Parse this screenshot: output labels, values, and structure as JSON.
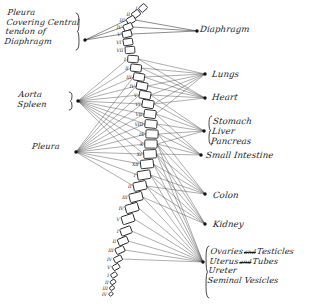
{
  "figure": {
    "background_color": "#ffffff",
    "ink_color": "#1a1a1a",
    "line_color": "#4a4a4a"
  },
  "left_labels": [
    {
      "id": "pleura-central-tendon",
      "lines": [
        "Pleura",
        "Covering Central",
        "tendon of",
        "Diaphragm"
      ],
      "x": 6,
      "y": 8,
      "brace": true
    },
    {
      "id": "aorta-spleen",
      "lines": [
        "Aorta",
        "Spleen"
      ],
      "x": 18,
      "y": 90,
      "brace": true
    },
    {
      "id": "pleura-lower",
      "lines": [
        "Pleura"
      ],
      "x": 32,
      "y": 142,
      "brace": false
    }
  ],
  "right_labels": [
    {
      "id": "diaphragm",
      "lines": [
        "Diaphragm"
      ],
      "x": 200,
      "y": 24,
      "brace": false
    },
    {
      "id": "lungs",
      "lines": [
        "Lungs"
      ],
      "x": 212,
      "y": 69,
      "brace": false
    },
    {
      "id": "heart",
      "lines": [
        "Heart"
      ],
      "x": 212,
      "y": 92,
      "brace": false
    },
    {
      "id": "stomach-liver-pancreas",
      "lines": [
        "Stomach",
        "Liver",
        "Pancreas"
      ],
      "x": 212,
      "y": 116,
      "brace": true
    },
    {
      "id": "small-intestine",
      "lines": [
        "Small Intestine"
      ],
      "x": 206,
      "y": 150,
      "brace": false
    },
    {
      "id": "colon",
      "lines": [
        "Colon"
      ],
      "x": 213,
      "y": 190,
      "brace": false
    },
    {
      "id": "kidney",
      "lines": [
        "Kidney"
      ],
      "x": 213,
      "y": 219,
      "brace": false
    },
    {
      "id": "pelvic-organs",
      "lines": [
        "Ovaries  Testicles",
        "Uterus  Tubes",
        "Ureter",
        "Seminal Vesicles"
      ],
      "x": 209,
      "y": 247,
      "brace": true
    }
  ],
  "pelvic_conjunctions": [
    "and",
    "and"
  ],
  "hubs": [
    {
      "id": "hub-diaphragm-left",
      "x": 85,
      "y": 40
    },
    {
      "id": "hub-aorta-spleen",
      "x": 78,
      "y": 101
    },
    {
      "id": "hub-pleura-lower",
      "x": 76,
      "y": 152
    },
    {
      "id": "hub-diaphragm-right",
      "x": 197,
      "y": 31
    },
    {
      "id": "hub-lungs",
      "x": 205,
      "y": 74
    },
    {
      "id": "hub-heart",
      "x": 205,
      "y": 98
    },
    {
      "id": "hub-stomach",
      "x": 204,
      "y": 131
    },
    {
      "id": "hub-small-intestine",
      "x": 201,
      "y": 155
    },
    {
      "id": "hub-colon",
      "x": 205,
      "y": 194
    },
    {
      "id": "hub-kidney",
      "x": 205,
      "y": 224
    },
    {
      "id": "hub-pelvic",
      "x": 203,
      "y": 262
    }
  ],
  "spine": {
    "label_note": "Roman numeral vertebra labels",
    "segments": [
      {
        "name": "cervical",
        "vertebrae": [
          {
            "label": "I",
            "x": 143,
            "y": 8,
            "w": 7.5,
            "h": 6.0,
            "rot": -42
          },
          {
            "label": "II",
            "x": 136,
            "y": 14,
            "w": 8.0,
            "h": 6.0,
            "rot": -36
          },
          {
            "label": "III",
            "x": 131,
            "y": 20,
            "w": 8.5,
            "h": 6.2,
            "rot": -30
          },
          {
            "label": "IV",
            "x": 128,
            "y": 27,
            "w": 9.0,
            "h": 6.4,
            "rot": -22
          },
          {
            "label": "V",
            "x": 127,
            "y": 34,
            "w": 9.2,
            "h": 6.5,
            "rot": -14
          },
          {
            "label": "VI",
            "x": 128,
            "y": 42,
            "w": 9.4,
            "h": 6.6,
            "rot": -8
          },
          {
            "label": "VII",
            "x": 130,
            "y": 50,
            "w": 9.6,
            "h": 6.8,
            "rot": -4
          }
        ]
      },
      {
        "name": "thoracic",
        "vertebrae": [
          {
            "label": "I",
            "x": 133,
            "y": 59,
            "w": 10.5,
            "h": 7.0,
            "rot": 4
          },
          {
            "label": "II",
            "x": 136,
            "y": 68,
            "w": 10.8,
            "h": 7.2,
            "rot": 7
          },
          {
            "label": "III",
            "x": 139,
            "y": 77,
            "w": 11.0,
            "h": 7.4,
            "rot": 9
          },
          {
            "label": "IV",
            "x": 142,
            "y": 86,
            "w": 11.2,
            "h": 7.5,
            "rot": 10
          },
          {
            "label": "V",
            "x": 145,
            "y": 95,
            "w": 11.4,
            "h": 7.6,
            "rot": 10
          },
          {
            "label": "VI",
            "x": 148,
            "y": 104,
            "w": 11.6,
            "h": 7.8,
            "rot": 9
          },
          {
            "label": "VII",
            "x": 150,
            "y": 114,
            "w": 11.8,
            "h": 8.0,
            "rot": 7
          },
          {
            "label": "VIII",
            "x": 151,
            "y": 124,
            "w": 12.0,
            "h": 8.0,
            "rot": 5
          },
          {
            "label": "IX",
            "x": 152,
            "y": 134,
            "w": 12.2,
            "h": 8.2,
            "rot": 2
          },
          {
            "label": "X",
            "x": 151,
            "y": 144,
            "w": 12.4,
            "h": 8.2,
            "rot": 0
          },
          {
            "label": "XI",
            "x": 150,
            "y": 154,
            "w": 12.6,
            "h": 8.4,
            "rot": -3
          },
          {
            "label": "XII",
            "x": 147,
            "y": 164,
            "w": 12.8,
            "h": 8.4,
            "rot": -6
          }
        ]
      },
      {
        "name": "lumbar",
        "vertebrae": [
          {
            "label": "I",
            "x": 144,
            "y": 175,
            "w": 13.0,
            "h": 8.6,
            "rot": -9
          },
          {
            "label": "II",
            "x": 140,
            "y": 186,
            "w": 13.0,
            "h": 8.6,
            "rot": -12
          },
          {
            "label": "III",
            "x": 136,
            "y": 197,
            "w": 13.0,
            "h": 8.6,
            "rot": -14
          },
          {
            "label": "IV",
            "x": 132,
            "y": 208,
            "w": 12.8,
            "h": 8.4,
            "rot": -16
          },
          {
            "label": "V",
            "x": 128,
            "y": 219,
            "w": 12.4,
            "h": 8.2,
            "rot": -18
          }
        ]
      },
      {
        "name": "sacral",
        "vertebrae": [
          {
            "label": "I",
            "x": 126,
            "y": 231,
            "w": 11.0,
            "h": 7.4,
            "rot": -20
          },
          {
            "label": "II",
            "x": 123,
            "y": 241,
            "w": 10.0,
            "h": 6.8,
            "rot": -22
          },
          {
            "label": "III",
            "x": 120,
            "y": 250,
            "w": 9.0,
            "h": 6.2,
            "rot": -24
          },
          {
            "label": "IV",
            "x": 118,
            "y": 259,
            "w": 8.0,
            "h": 5.6,
            "rot": -26
          },
          {
            "label": "V",
            "x": 116,
            "y": 267,
            "w": 7.0,
            "h": 5.0,
            "rot": -28
          }
        ]
      },
      {
        "name": "coccygeal",
        "vertebrae": [
          {
            "label": "I",
            "x": 114,
            "y": 275,
            "w": 6.0,
            "h": 4.4,
            "rot": -30
          },
          {
            "label": "II",
            "x": 113,
            "y": 282,
            "w": 5.2,
            "h": 4.0,
            "rot": -32
          },
          {
            "label": "III",
            "x": 112,
            "y": 288,
            "w": 4.6,
            "h": 3.6,
            "rot": -34
          },
          {
            "label": "IV",
            "x": 111,
            "y": 294,
            "w": 4.0,
            "h": 3.2,
            "rot": -36
          }
        ]
      }
    ]
  }
}
